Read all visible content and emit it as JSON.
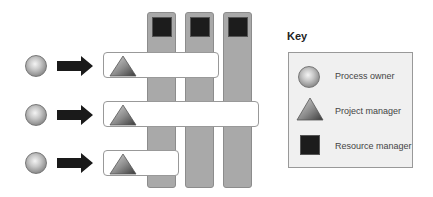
{
  "diagram": {
    "columns": [
      {
        "id": "resource-1",
        "role": "Resource manager"
      },
      {
        "id": "resource-2",
        "role": "Resource manager"
      },
      {
        "id": "resource-3",
        "role": "Resource manager"
      }
    ],
    "rows": [
      {
        "owner": "Process owner",
        "project": "Project manager",
        "spans_columns": 2
      },
      {
        "owner": "Process owner",
        "project": "Project manager",
        "spans_columns": 3
      },
      {
        "owner": "Process owner",
        "project": "Project manager",
        "spans_columns": 1
      }
    ]
  },
  "key": {
    "title": "Key",
    "items": [
      {
        "symbol": "circle",
        "label": "Process owner"
      },
      {
        "symbol": "triangle",
        "label": "Project manager"
      },
      {
        "symbol": "square",
        "label": "Resource manager"
      }
    ]
  },
  "colors": {
    "column_fill": "#a9a9a9",
    "square_fill": "#1c1c1c",
    "arrow_fill": "#1a1a1a",
    "bar_fill": "#ffffff",
    "key_fill": "#f0f0f0"
  }
}
